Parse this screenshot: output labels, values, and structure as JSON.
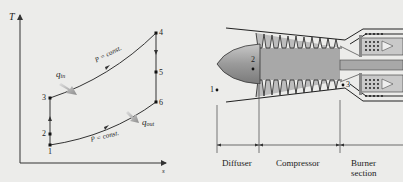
{
  "ts_diagram": {
    "y_axis_label": "T",
    "x_axis_label": "s",
    "points": [
      {
        "id": "1",
        "label": "1"
      },
      {
        "id": "2",
        "label": "2"
      },
      {
        "id": "3",
        "label": "3"
      },
      {
        "id": "4",
        "label": "4"
      },
      {
        "id": "5",
        "label": "5"
      },
      {
        "id": "6",
        "label": "6"
      }
    ],
    "upper_curve_label": "P = const.",
    "lower_curve_label": "P = const.",
    "heat_in": {
      "symbol": "q",
      "subscript": "in"
    },
    "heat_out": {
      "symbol": "q",
      "subscript": "out"
    },
    "colors": {
      "line": "#333333",
      "arrow": "#9a9a9a"
    }
  },
  "engine_diagram": {
    "station_labels": {
      "s1": "1",
      "s2": "2",
      "s3": "3"
    },
    "sections": [
      "Diffuser",
      "Compressor",
      "Burner section"
    ],
    "colors": {
      "body": "#a8a8a8",
      "nose": "#9c9c9c",
      "outline": "#2a2a2a"
    }
  }
}
